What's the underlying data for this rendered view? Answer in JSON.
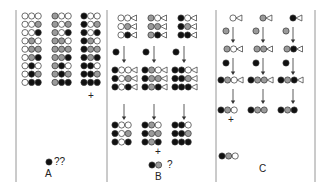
{
  "colors": {
    "white": "#ffffff",
    "gray": "#9a9a9a",
    "black": "#111111",
    "stroke": "#333333",
    "divider": "#8a8a8a",
    "arrow": "#333333"
  },
  "panels": [
    {
      "id": "A",
      "label": "A",
      "grid_columns": [
        [
          "WWW",
          "WWG",
          "WWB",
          "WGW",
          "WGG",
          "WGB",
          "WBW",
          "WBG",
          "WBB"
        ],
        [
          "GWW",
          "GWG",
          "GWB",
          "GGW",
          "GGG",
          "GGB",
          "GBW",
          "GBG",
          "GBB"
        ],
        [
          "BWW",
          "BWG",
          "BWB",
          "BGW",
          "BGG",
          "BGB",
          "BBW",
          "BBG",
          "BBB"
        ]
      ],
      "plus_marker": "+",
      "result": {
        "beads": "B",
        "annotation": "??"
      }
    },
    {
      "id": "B",
      "label": "B",
      "columns": [
        {
          "initial": [
            "WW",
            "WG",
            "WB"
          ],
          "added_bead": "B",
          "after_add": [
            "BWW",
            "BWG",
            "BWB"
          ],
          "final": [
            "BWW",
            "BWG",
            "BWB"
          ]
        },
        {
          "initial": [
            "GW",
            "GG",
            "GB"
          ],
          "added_bead": "B",
          "after_add": [
            "BGW",
            "BGG",
            "BGB"
          ],
          "final": [
            "BGW",
            "BGG",
            "BGB"
          ]
        },
        {
          "initial": [
            "BW",
            "BG",
            "BB"
          ],
          "added_bead": "B",
          "after_add": [
            "BBW",
            "BBG",
            "BBB"
          ],
          "final": [
            "BBW",
            "BBG",
            "BBB"
          ]
        }
      ],
      "plus_marker": "+",
      "result": {
        "beads": "BG",
        "annotation": "?"
      }
    },
    {
      "id": "C",
      "label": "C",
      "columns": [
        {
          "step1": "W",
          "add1": "G",
          "step2": "GW",
          "add2": "B",
          "step3": "BGW",
          "final": "BGW"
        },
        {
          "step1": "G",
          "add1": "G",
          "step2": "GG",
          "add2": "B",
          "step3": "BGG",
          "final": "BGG"
        },
        {
          "step1": "B",
          "add1": "G",
          "step2": "GB",
          "add2": "B",
          "step3": "BGB",
          "final": "BGB"
        }
      ],
      "plus_marker": "+",
      "result": {
        "beads": "BGW",
        "annotation": ""
      }
    }
  ]
}
